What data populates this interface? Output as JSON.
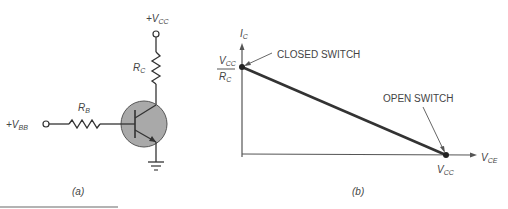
{
  "circuit": {
    "vcc_label": "+V",
    "vcc_sub": "CC",
    "rc_label": "R",
    "rc_sub": "C",
    "rb_label": "R",
    "rb_sub": "B",
    "vbb_label": "+V",
    "vbb_sub": "BB",
    "caption": "(a)"
  },
  "graph": {
    "y_axis_label": "I",
    "y_axis_sub": "C",
    "x_axis_label": "V",
    "x_axis_sub": "CE",
    "y_intercept_num": "V",
    "y_intercept_num_sub": "CC",
    "y_intercept_den": "R",
    "y_intercept_den_sub": "C",
    "x_intercept": "V",
    "x_intercept_sub": "CC",
    "closed_annotation": "CLOSED SWITCH",
    "open_annotation": "OPEN SWITCH",
    "caption": "(b)"
  },
  "colors": {
    "line": "#333333",
    "transistor_fill": "#a9a9a9",
    "rule": "#9a9a9a"
  }
}
